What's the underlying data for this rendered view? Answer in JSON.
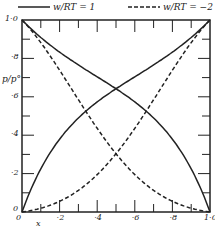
{
  "chart_data": {
    "type": "line",
    "title": "",
    "xlabel": "x",
    "ylabel": "p/p°",
    "xlim": [
      0,
      1
    ],
    "ylim": [
      0,
      1
    ],
    "grid": false,
    "legend_position": "top",
    "x_ticks": [
      "0",
      "·2",
      "·4",
      "·6",
      "·8",
      "1·0"
    ],
    "y_ticks": [
      "0",
      "·2",
      "·4",
      "·6",
      "·8",
      "1·0"
    ],
    "x": [
      0,
      0.1,
      0.2,
      0.3,
      0.4,
      0.5,
      0.6,
      0.7,
      0.8,
      0.9,
      1.0
    ],
    "series": [
      {
        "name": "w/RT = 1 (component 1, rising)",
        "style": "solid",
        "values": [
          0,
          0.225,
          0.38,
          0.489,
          0.573,
          0.642,
          0.704,
          0.766,
          0.833,
          0.909,
          1.0
        ]
      },
      {
        "name": "w/RT = 1 (component 2, falling)",
        "style": "solid",
        "values": [
          1.0,
          0.909,
          0.833,
          0.766,
          0.704,
          0.642,
          0.573,
          0.489,
          0.38,
          0.225,
          0
        ]
      },
      {
        "name": "w/RT = -2 (component 1, rising)",
        "style": "dashed",
        "values": [
          0,
          0.02,
          0.056,
          0.113,
          0.195,
          0.303,
          0.434,
          0.583,
          0.738,
          0.882,
          1.0
        ]
      },
      {
        "name": "w/RT = -2 (component 2, falling)",
        "style": "dashed",
        "values": [
          1.0,
          0.882,
          0.738,
          0.583,
          0.434,
          0.303,
          0.195,
          0.113,
          0.056,
          0.02,
          0
        ]
      }
    ],
    "legend": [
      "w/RT = 1",
      "w/RT = −2"
    ],
    "line_color": "#222222"
  },
  "legend": {
    "solid_label": "w/RT = 1",
    "dashed_label": "w/RT = −2"
  },
  "axes": {
    "xlabel": "x",
    "ylabel": "p/p°"
  }
}
